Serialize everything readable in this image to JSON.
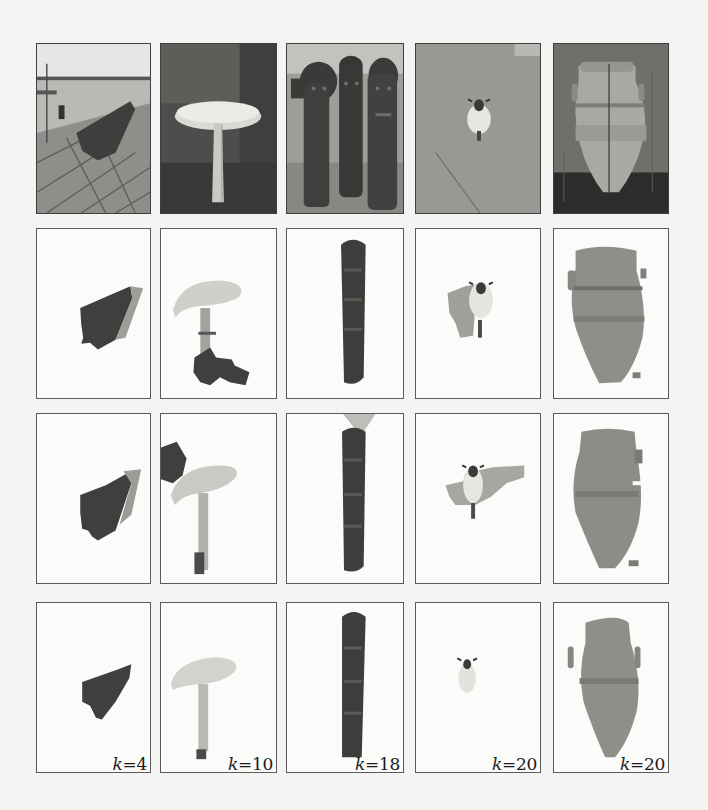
{
  "figure": {
    "layout": {
      "rows": 4,
      "columns": 5
    },
    "columns": [
      {
        "subject": "boat-on-dock"
      },
      {
        "subject": "mushroom"
      },
      {
        "subject": "wooden-totems"
      },
      {
        "subject": "sheep-in-field"
      },
      {
        "subject": "amphora-vase"
      }
    ],
    "rows": [
      {
        "role": "original-photographs"
      },
      {
        "role": "segmentation-result-a"
      },
      {
        "role": "segmentation-result-b"
      },
      {
        "role": "segmentation-result-c"
      }
    ],
    "k_labels": [
      {
        "var": "k",
        "eq": "=",
        "value": "4"
      },
      {
        "var": "k",
        "eq": "=",
        "value": "10"
      },
      {
        "var": "k",
        "eq": "=",
        "value": "18"
      },
      {
        "var": "k",
        "eq": "=",
        "value": "20"
      },
      {
        "var": "k",
        "eq": "=",
        "value": "20"
      }
    ]
  }
}
